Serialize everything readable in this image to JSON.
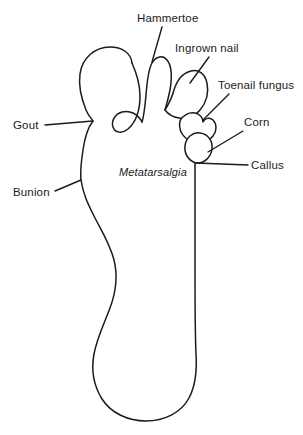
{
  "figure": {
    "stroke_color": "#1b1b1b",
    "background_color": "#ffffff",
    "view": "right foot, sole / plantar aspect"
  },
  "labels": {
    "hammertoe": "Hammertoe",
    "ingrown_nail": "Ingrown nail",
    "toenail_fungus": "Toenail fungus",
    "corn": "Corn",
    "callus": "Callus",
    "gout": "Gout",
    "bunion": "Bunion",
    "metatarsalgia": "Metatarsalgia"
  },
  "annotations": [
    {
      "id": "hammertoe",
      "text": "Hammertoe",
      "text_x": 137,
      "text_y": 22,
      "anchor": "start",
      "target_x": 152,
      "target_y": 62,
      "line_from_x": 162,
      "line_from_y": 27
    },
    {
      "id": "ingrown-nail",
      "text": "Ingrown nail",
      "text_x": 175,
      "text_y": 52,
      "anchor": "start",
      "target_x": 190,
      "target_y": 83,
      "line_from_x": 209,
      "line_from_y": 57
    },
    {
      "id": "toenail-fungus",
      "text": "Toenail fungus",
      "text_x": 218,
      "text_y": 89,
      "anchor": "start",
      "target_x": 203,
      "target_y": 120,
      "line_from_x": 229,
      "line_from_y": 94
    },
    {
      "id": "corn",
      "text": "Corn",
      "text_x": 244,
      "text_y": 126,
      "anchor": "start",
      "target_x": 208,
      "target_y": 152,
      "line_from_x": 243,
      "line_from_y": 131
    },
    {
      "id": "callus",
      "text": "Callus",
      "text_x": 251,
      "text_y": 169,
      "anchor": "start",
      "target_x": 196,
      "target_y": 163,
      "line_from_x": 248,
      "line_from_y": 165
    },
    {
      "id": "gout",
      "text": "Gout",
      "text_x": 13,
      "text_y": 129,
      "anchor": "start",
      "target_x": 93,
      "target_y": 121,
      "line_from_x": 45,
      "line_from_y": 125
    },
    {
      "id": "bunion",
      "text": "Bunion",
      "text_x": 13,
      "text_y": 196,
      "anchor": "start",
      "target_x": 81,
      "target_y": 180,
      "line_from_x": 55,
      "line_from_y": 191
    },
    {
      "id": "metatarsalgia",
      "text": "Metatarsalgia",
      "text_x": 119,
      "text_y": 176,
      "anchor": "start",
      "target_x": null,
      "target_y": null,
      "line_from_x": null,
      "line_from_y": null
    }
  ],
  "conditions_list": [
    "Hammertoe",
    "Ingrown nail",
    "Toenail fungus",
    "Corn",
    "Callus",
    "Gout",
    "Bunion",
    "Metatarsalgia"
  ]
}
